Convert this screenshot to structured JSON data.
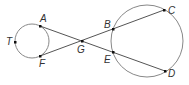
{
  "diagram": {
    "colors": {
      "stroke": "#555555",
      "circle": "#888888",
      "point": "#111111",
      "label": "#333333"
    },
    "circles": [
      {
        "id": "small",
        "cx": 32,
        "cy": 41,
        "r": 17
      },
      {
        "id": "large",
        "cx": 147,
        "cy": 41,
        "r": 36
      }
    ],
    "points": {
      "T": {
        "label": "T",
        "x": 15,
        "y": 42
      },
      "A": {
        "label": "A",
        "x": 40,
        "y": 26
      },
      "F": {
        "label": "F",
        "x": 40,
        "y": 56
      },
      "G": {
        "label": "G",
        "x": 82,
        "y": 41
      },
      "B": {
        "label": "B",
        "x": 113,
        "y": 29
      },
      "E": {
        "label": "E",
        "x": 113,
        "y": 52
      },
      "C": {
        "label": "C",
        "x": 164,
        "y": 10
      },
      "D": {
        "label": "D",
        "x": 165,
        "y": 71
      }
    },
    "segments": [
      {
        "from": "A",
        "to": "D"
      },
      {
        "from": "F",
        "to": "C"
      }
    ]
  }
}
